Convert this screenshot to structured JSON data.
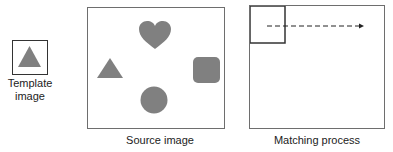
{
  "template": {
    "label_line1": "Template",
    "label_line2": "image",
    "shape": "triangle-icon"
  },
  "source": {
    "label": "Source image",
    "shapes": [
      "heart-icon",
      "triangle-icon",
      "rounded-square-icon",
      "circle-icon"
    ]
  },
  "matching": {
    "label": "Matching process",
    "arrow": "dashed-arrow-right"
  },
  "colors": {
    "shape_fill": "#808080",
    "frame_stroke": "#6e6e6e",
    "window_stroke": "#333333"
  }
}
